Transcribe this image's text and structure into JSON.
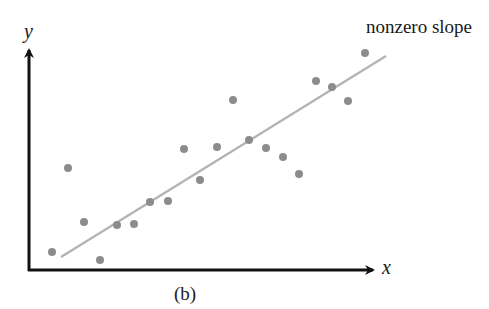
{
  "chart_data": {
    "type": "scatter",
    "title": "",
    "caption": "(b)",
    "xlabel": "x",
    "ylabel": "y",
    "annotation": "nonzero slope",
    "grid": false,
    "legend": null,
    "ticks": {
      "x": [],
      "y": []
    },
    "xlim": [
      0,
      10
    ],
    "ylim": [
      0,
      10
    ],
    "points": [
      {
        "x": 0.7,
        "y": 0.8
      },
      {
        "x": 1.1,
        "y": 4.6
      },
      {
        "x": 1.6,
        "y": 2.2
      },
      {
        "x": 2.0,
        "y": 0.5
      },
      {
        "x": 2.5,
        "y": 2.0
      },
      {
        "x": 3.0,
        "y": 2.1
      },
      {
        "x": 3.5,
        "y": 3.1
      },
      {
        "x": 4.0,
        "y": 3.1
      },
      {
        "x": 4.5,
        "y": 5.4
      },
      {
        "x": 5.0,
        "y": 4.0
      },
      {
        "x": 5.5,
        "y": 5.5
      },
      {
        "x": 6.0,
        "y": 7.6
      },
      {
        "x": 6.5,
        "y": 5.8
      },
      {
        "x": 7.0,
        "y": 5.5
      },
      {
        "x": 7.5,
        "y": 5.1
      },
      {
        "x": 8.0,
        "y": 4.3
      },
      {
        "x": 8.5,
        "y": 8.6
      },
      {
        "x": 9.0,
        "y": 8.3
      },
      {
        "x": 9.5,
        "y": 7.6
      },
      {
        "x": 10.0,
        "y": 9.7
      }
    ],
    "fit_line": {
      "x": [
        1.0,
        10.6
      ],
      "y": [
        0.6,
        9.7
      ],
      "label": "nonzero slope"
    }
  },
  "colors": {
    "axis": "#111111",
    "points": "#8c8c8c",
    "fit_line": "#b3b3b3",
    "text": "#1a1a1a"
  },
  "pixel_points": [
    [
      52,
      252
    ],
    [
      68,
      168
    ],
    [
      84,
      222
    ],
    [
      100,
      260
    ],
    [
      117,
      225
    ],
    [
      134,
      224
    ],
    [
      150,
      202
    ],
    [
      168,
      201
    ],
    [
      184,
      149
    ],
    [
      200,
      180
    ],
    [
      217,
      147
    ],
    [
      233,
      100
    ],
    [
      249,
      140
    ],
    [
      266,
      148
    ],
    [
      283,
      157
    ],
    [
      299,
      174
    ],
    [
      316,
      81
    ],
    [
      332,
      87
    ],
    [
      348,
      101
    ],
    [
      365,
      53
    ]
  ],
  "pixel_line": [
    61,
    257,
    386,
    56
  ]
}
